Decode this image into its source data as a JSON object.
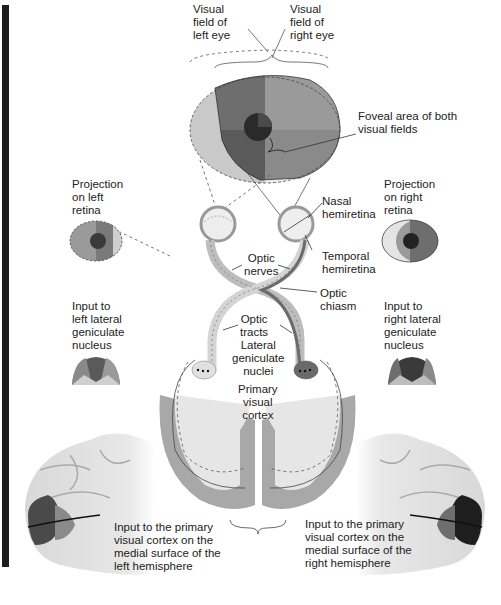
{
  "figure": {
    "colors": {
      "left_field_light": "#c9c9c9",
      "mid_gray": "#9a9a9a",
      "dark_gray": "#6e6e6e",
      "darker_gray": "#5a5a5a",
      "fovea": "#2a2a2a",
      "cortex_gray": "#a8a8a8",
      "white_matter": "#e6e6e6",
      "margin_bar": "#1e1e1e"
    }
  },
  "labels": {
    "visual_field_left": "Visual\nfield of\nleft eye",
    "visual_field_right": "Visual\nfield of\nright eye",
    "foveal_area": "Foveal area of both\nvisual fields",
    "projection_left_retina": "Projection\non left\nretina",
    "projection_right_retina": "Projection\non right\nretina",
    "nasal_hemiretina": "Nasal\nhemiretina",
    "temporal_hemiretina": "Temporal\nhemiretina",
    "optic_nerves": "Optic\nnerves",
    "optic_chiasm": "Optic\nchiasm",
    "optic_tracts": "Optic\ntracts",
    "lateral_geniculate_nuclei": "Lateral\ngeniculate\nnuclei",
    "input_left_lgn": "Input to\nleft lateral\ngeniculate\nnucleus",
    "input_right_lgn": "Input to\nright lateral\ngeniculate\nnucleus",
    "primary_visual_cortex": "Primary\nvisual\ncortex",
    "input_cortex_left": "Input to the primary\nvisual cortex on the\nmedial surface of the\nleft hemisphere",
    "input_cortex_right": "Input to the primary\nvisual cortex on the\nmedial surface of the\nright hemisphere"
  }
}
